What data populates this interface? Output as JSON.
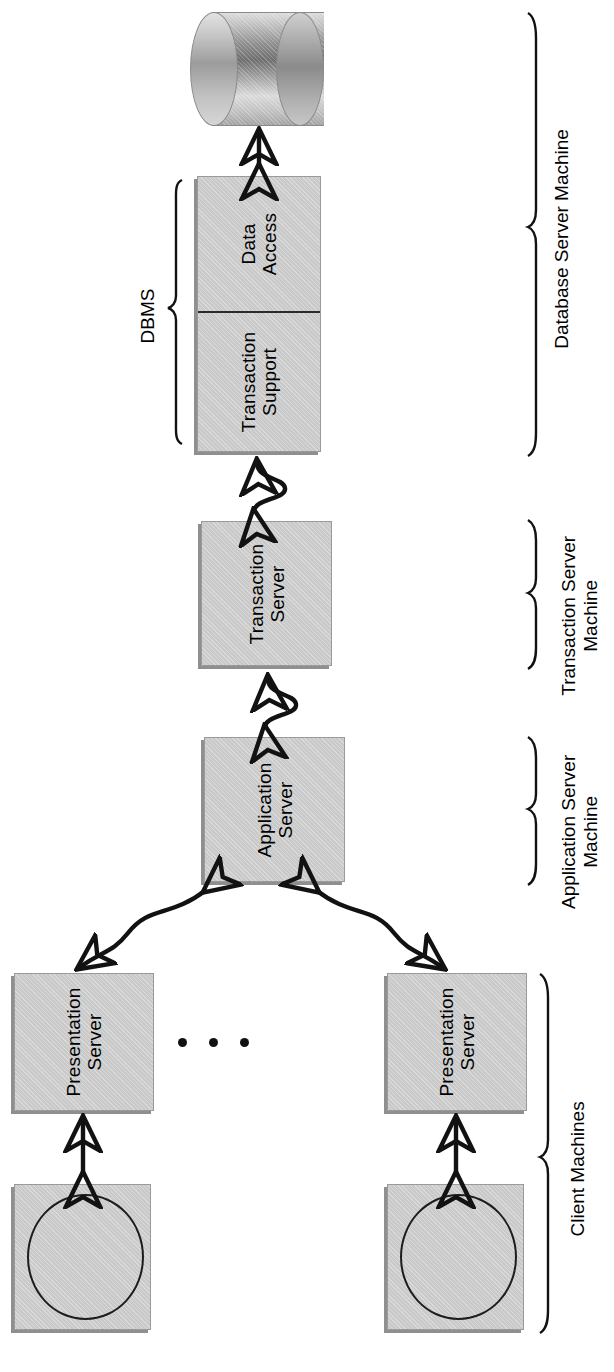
{
  "diagram": {
    "orientation": "rotated-90-ccw",
    "nodes": {
      "database": {
        "label": "",
        "shape": "cylinder",
        "name": "database-cylinder"
      },
      "dbms_data_access": {
        "label": "Data\nAccess"
      },
      "dbms_transaction_support": {
        "label": "Transaction\nSupport"
      },
      "transaction_server": {
        "label": "Transaction\nServer"
      },
      "application_server": {
        "label": "Application\nServer"
      },
      "presentation_server_1": {
        "label": "Presentation\nServer"
      },
      "presentation_server_2": {
        "label": "Presentation\nServer"
      },
      "client_terminal_1": {
        "label": "",
        "shape": "box-with-circle"
      },
      "client_terminal_2": {
        "label": "",
        "shape": "box-with-circle"
      }
    },
    "group_braces": [
      {
        "id": "dbms",
        "label": "DBMS",
        "side": "left"
      },
      {
        "id": "database-server",
        "label": "Database Server Machine",
        "side": "right"
      },
      {
        "id": "transaction-server",
        "label": "Transaction Server\nMachine",
        "side": "right"
      },
      {
        "id": "application-server",
        "label": "Application Server\nMachine",
        "side": "right"
      },
      {
        "id": "client-machines",
        "label": "Client Machines",
        "side": "right"
      }
    ],
    "labels": {
      "data_access": "Data Access",
      "data_access_l1": "Data",
      "data_access_l2": "Access",
      "transaction_support_l1": "Transaction",
      "transaction_support_l2": "Support",
      "transaction_server_l1": "Transaction",
      "transaction_server_l2": "Server",
      "application_server_l1": "Application",
      "application_server_l2": "Server",
      "presentation_server_l1": "Presentation",
      "presentation_server_l2": "Server",
      "dbms_brace": "DBMS",
      "database_server_machine": "Database Server Machine",
      "transaction_server_machine_l1": "Transaction Server",
      "transaction_server_machine_l2": "Machine",
      "application_server_machine_l1": "Application Server",
      "application_server_machine_l2": "Machine",
      "client_machines": "Client Machines",
      "ellipsis": "• • •"
    },
    "connections": [
      {
        "from": "dbms_data_access",
        "to": "database",
        "style": "straight",
        "arrowheads": "both"
      },
      {
        "from": "transaction_server",
        "to": "dbms_transaction_support",
        "style": "s-curve",
        "arrowheads": "both"
      },
      {
        "from": "application_server",
        "to": "transaction_server",
        "style": "s-curve",
        "arrowheads": "both"
      },
      {
        "from": "presentation_server_1",
        "to": "application_server",
        "style": "s-curve",
        "arrowheads": "both"
      },
      {
        "from": "presentation_server_2",
        "to": "application_server",
        "style": "s-curve",
        "arrowheads": "both"
      },
      {
        "from": "client_terminal_1",
        "to": "presentation_server_1",
        "style": "straight",
        "arrowheads": "both"
      },
      {
        "from": "client_terminal_2",
        "to": "presentation_server_2",
        "style": "straight",
        "arrowheads": "both"
      }
    ],
    "colors": {
      "box_fill": "#c9c9c9",
      "box_border": "#9a9a9a",
      "box_shadow": "#8f8f8f",
      "stroke": "#121212",
      "background": "#ffffff"
    }
  }
}
